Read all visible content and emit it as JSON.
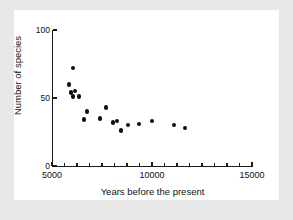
{
  "chart_data": {
    "type": "scatter",
    "title": "",
    "xlabel": "Years before the present",
    "ylabel": "Number of species",
    "xlim": [
      5000,
      15000
    ],
    "ylim": [
      0,
      100
    ],
    "xticks": [
      5000,
      10000,
      15000
    ],
    "xtick_labels": [
      "5000",
      "10000",
      "15000"
    ],
    "yticks": [
      0,
      50,
      100
    ],
    "ytick_labels": [
      "0",
      "50",
      "100"
    ],
    "x_minor_tick_step": 625,
    "grid": false,
    "legend": null,
    "marker": "filled-circle",
    "marker_color": "#111111",
    "background_color": "#e8e8e8",
    "plot_background_color": "#ffffff",
    "axis_color": "#1a1a1a",
    "points": [
      {
        "x": 6050,
        "y": 72
      },
      {
        "x": 5850,
        "y": 60
      },
      {
        "x": 5950,
        "y": 54
      },
      {
        "x": 6150,
        "y": 55
      },
      {
        "x": 6050,
        "y": 51
      },
      {
        "x": 6350,
        "y": 51
      },
      {
        "x": 6750,
        "y": 40
      },
      {
        "x": 6600,
        "y": 34
      },
      {
        "x": 7400,
        "y": 35
      },
      {
        "x": 7700,
        "y": 43
      },
      {
        "x": 8050,
        "y": 32
      },
      {
        "x": 8250,
        "y": 33
      },
      {
        "x": 8450,
        "y": 26
      },
      {
        "x": 8800,
        "y": 30
      },
      {
        "x": 9350,
        "y": 31
      },
      {
        "x": 10000,
        "y": 33
      },
      {
        "x": 11100,
        "y": 30
      },
      {
        "x": 11650,
        "y": 28
      }
    ]
  }
}
